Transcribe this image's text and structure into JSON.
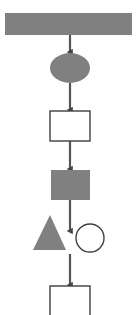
{
  "canvas": {
    "width": 138,
    "height": 315,
    "background": "#ffffff",
    "title": "Vertical flowchart diagram"
  },
  "style": {
    "fill_gray": "#808080",
    "fill_white": "#ffffff",
    "stroke_dark": "#3f3f3f",
    "connector_color": "#555555",
    "shape_border_width": 1.4,
    "connector_width": 2.2
  },
  "shapes": [
    {
      "id": "top-bar",
      "type": "rectangle",
      "role": "header-bar",
      "label": "",
      "fill": "#808080",
      "stroke": "none",
      "x": 5,
      "y": 13,
      "width": 127,
      "height": 22
    },
    {
      "id": "ellipse-node",
      "type": "ellipse",
      "role": "terminator",
      "label": "",
      "fill": "#808080",
      "stroke": "none",
      "cx": 70,
      "cy": 68,
      "rx": 20,
      "ry": 15
    },
    {
      "id": "process-box-1",
      "type": "rectangle",
      "role": "process",
      "label": "",
      "fill": "#ffffff",
      "stroke": "#3f3f3f",
      "x": 50,
      "y": 111,
      "width": 40,
      "height": 30
    },
    {
      "id": "filled-box",
      "type": "rectangle",
      "role": "process-filled",
      "label": "",
      "fill": "#808080",
      "stroke": "none",
      "x": 51,
      "y": 170,
      "width": 39,
      "height": 30
    },
    {
      "id": "triangle-node",
      "type": "triangle",
      "role": "decision-marker",
      "label": "",
      "fill": "#808080",
      "stroke": "none",
      "apex_x": 50,
      "apex_y": 215,
      "base_y": 250,
      "base_left_x": 33,
      "base_right_x": 66
    },
    {
      "id": "circle-node",
      "type": "circle",
      "role": "connector-node",
      "label": "",
      "fill": "#ffffff",
      "stroke": "#3f3f3f",
      "cx": 90,
      "cy": 238,
      "r": 14
    },
    {
      "id": "process-box-2",
      "type": "rectangle",
      "role": "process",
      "label": "",
      "fill": "#ffffff",
      "stroke": "#3f3f3f",
      "x": 50,
      "y": 286,
      "width": 40,
      "height": 30
    }
  ],
  "connectors": [
    {
      "id": "arrow-bar-to-ellipse",
      "from": "top-bar",
      "to": "ellipse-node",
      "x": 70,
      "y_start": 35,
      "y_end": 52,
      "arrowhead": "end"
    },
    {
      "id": "arrow-ellipse-to-box1",
      "from": "ellipse-node",
      "to": "process-box-1",
      "x": 70,
      "y_start": 83,
      "y_end": 110,
      "arrowhead": "end"
    },
    {
      "id": "arrow-box1-to-filledbox",
      "from": "process-box-1",
      "to": "filled-box",
      "x": 70,
      "y_start": 141,
      "y_end": 169,
      "arrowhead": "end"
    },
    {
      "id": "arrow-filledbox-to-circle-row",
      "from": "filled-box",
      "to": "circle-node",
      "x": 70,
      "y_start": 200,
      "y_end": 231,
      "arrowhead": "end"
    },
    {
      "id": "arrow-circle-row-to-box2",
      "from": "circle-node",
      "to": "process-box-2",
      "x": 70,
      "y_start": 254,
      "y_end": 285,
      "arrowhead": "end"
    }
  ]
}
